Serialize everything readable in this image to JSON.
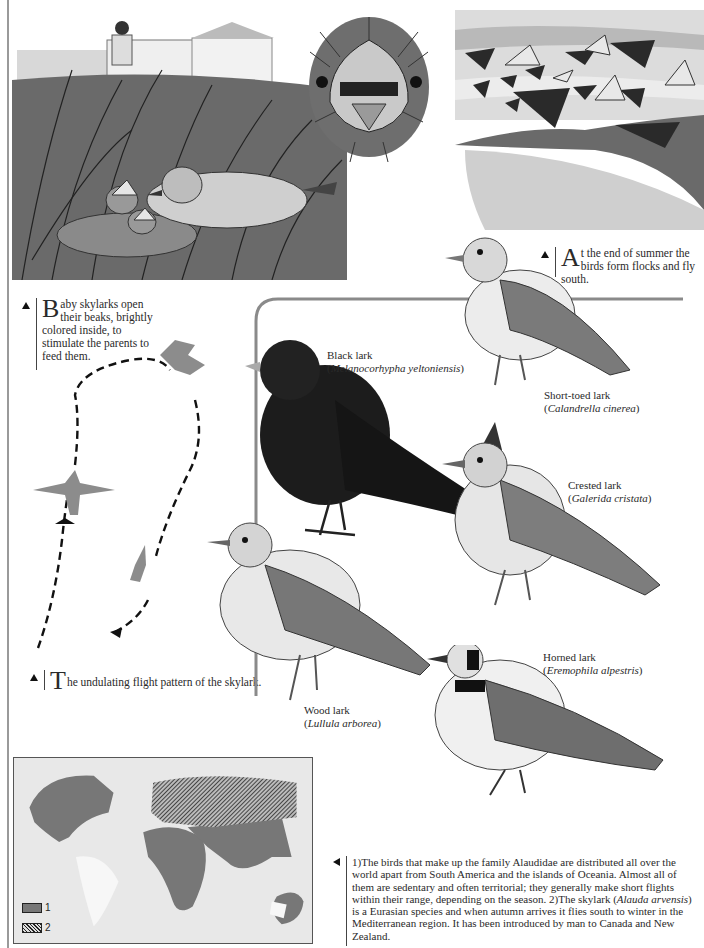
{
  "captions": {
    "baby_beaks": {
      "dropcap": "B",
      "text": "aby skylarks open their beaks, brightly colored inside, to stimulate the parents to feed them."
    },
    "flocks": {
      "dropcap": "A",
      "text": "t the end of summer the birds form flocks and fly south."
    },
    "flight_pattern": {
      "dropcap": "T",
      "text": "he undulating flight pattern of the skylark."
    }
  },
  "species": [
    {
      "common": "Black lark",
      "scientific": "Melanocorhypha yeltoniensis"
    },
    {
      "common": "Short-toed lark",
      "scientific": "Calandrella cinerea"
    },
    {
      "common": "Crested lark",
      "scientific": "Galerida cristata"
    },
    {
      "common": "Wood lark",
      "scientific": "Lullula arborea"
    },
    {
      "common": "Horned lark",
      "scientific": "Eremophila alpestris"
    }
  ],
  "map": {
    "legend": [
      {
        "label": "1",
        "color": "#777777"
      },
      {
        "label": "2",
        "pattern": "hatched"
      }
    ]
  },
  "body_text": {
    "part1": "1)The birds that make up the family Alaudidae are distributed all over the world apart from South America and the islands of Oceania. Almost all of them are sedentary and often territorial; they generally make short flights within their range, depending on the season. 2)The skylark (",
    "italic": "Alauda arvensis",
    "part2": ") is a Eurasian species and when autumn arrives it flies south to winter in the Mediterranean region. It has been introduced by man to Canada and New Zealand."
  },
  "colors": {
    "rule": "#8a8a8a",
    "map_land": "#777777",
    "map_bg": "#e8e8e8",
    "silhouette": "#8c8c8c"
  }
}
